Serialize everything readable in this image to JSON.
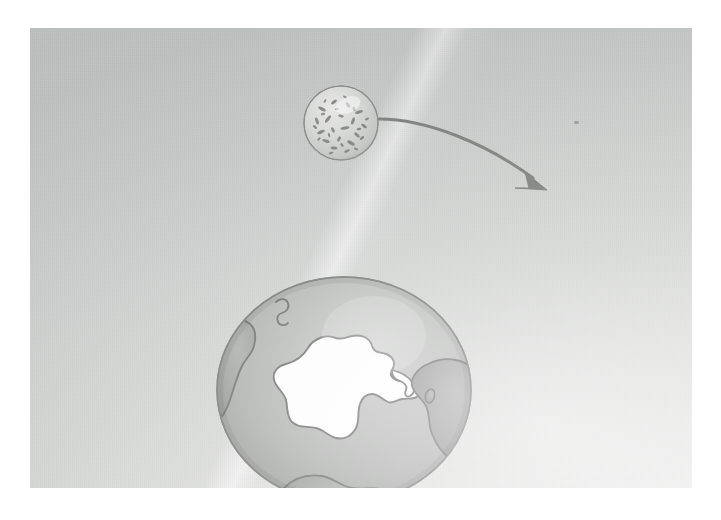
{
  "figure": {
    "domain": "scientific-illustration",
    "caption_text": "",
    "background_color": "#ffffff",
    "panel_color": "#d3d5d3",
    "ink_color": "#7d7f7e",
    "land_color": "#9a9c9a",
    "ocean_color": "#b4b6b4",
    "ice_color": "#fefefe"
  },
  "elements": {
    "micro_sphere": {
      "name": "speckled microsphere",
      "label": "",
      "center_x": 311,
      "center_y": 95,
      "radius": 40,
      "fill": "#dcdedc",
      "outline": "#8c8e8c",
      "speckle_color": "#6f716f",
      "description": "small spherical body with mottled dark speckles"
    },
    "transfer_arrow": {
      "name": "curved transfer arrow",
      "label": "",
      "from_x": 352,
      "from_y": 90,
      "to_x": 525,
      "to_y": 158,
      "color": "#7e807e",
      "stroke_width": 3,
      "direction": "down-right"
    },
    "earth_globe": {
      "name": "earth south polar view",
      "label": "",
      "center_x": 314,
      "center_y": 362,
      "radius_x": 128,
      "radius_y": 114,
      "ocean_fill": "#b3b5b3",
      "land_fill": "#9b9d9b",
      "land_outline": "#6e706e",
      "ice_fill": "#fdfdfd",
      "highlight": "#cbcdcb",
      "landmasses": [
        "Antarctica",
        "South America",
        "Africa",
        "Madagascar",
        "Australia",
        "Falkland Islands"
      ]
    },
    "scan_speck": {
      "name": "scan dust speck",
      "label": "",
      "x": 546,
      "y": 94,
      "color": "#8f918f"
    },
    "fold_line": {
      "name": "paper fold highlight",
      "label": "",
      "color": "#f2f3f1",
      "angle_deg": 115
    }
  }
}
